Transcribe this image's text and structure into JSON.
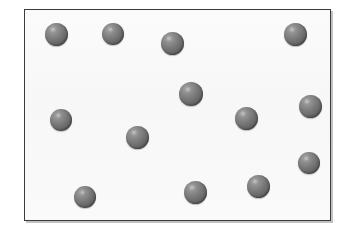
{
  "diagram": {
    "kind": "particle-box-diagram",
    "background_color": "#ffffff",
    "container": {
      "name": "container-box",
      "x": 24,
      "y": 9,
      "width": 307,
      "height": 212,
      "fill_color": "#f9f9f9",
      "border_color": "#3b3b3b",
      "border_width": 1,
      "shadow_color": "#787878"
    },
    "particle_style": {
      "shape": "sphere",
      "base_color": "#6e6e6e",
      "highlight_color": "#a9a9a9",
      "shadow_color": "#444444",
      "count": 15
    },
    "particles": [
      {
        "id": 1,
        "cx": 56,
        "cy": 34,
        "d": 23
      },
      {
        "id": 2,
        "cx": 113,
        "cy": 34,
        "d": 22
      },
      {
        "id": 3,
        "cx": 172,
        "cy": 43,
        "d": 23
      },
      {
        "id": 4,
        "cx": 295,
        "cy": 34,
        "d": 23
      },
      {
        "id": 5,
        "cx": 191,
        "cy": 94,
        "d": 24
      },
      {
        "id": 6,
        "cx": 61,
        "cy": 120,
        "d": 22
      },
      {
        "id": 7,
        "cx": 310,
        "cy": 106,
        "d": 23
      },
      {
        "id": 8,
        "cx": 246,
        "cy": 118,
        "d": 23
      },
      {
        "id": 9,
        "cx": 137,
        "cy": 137,
        "d": 23
      },
      {
        "id": 10,
        "cx": 309,
        "cy": 163,
        "d": 22
      },
      {
        "id": 11,
        "cx": 258,
        "cy": 186,
        "d": 23
      },
      {
        "id": 12,
        "cx": 195,
        "cy": 192,
        "d": 23
      },
      {
        "id": 13,
        "cx": 85,
        "cy": 197,
        "d": 22
      }
    ]
  }
}
